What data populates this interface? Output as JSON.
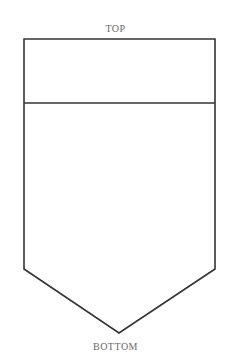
{
  "diagram": {
    "top_label": "TOP",
    "bottom_label": "BOTTOM",
    "stroke_color": "#333333",
    "label_color": "#6a6a6a"
  }
}
